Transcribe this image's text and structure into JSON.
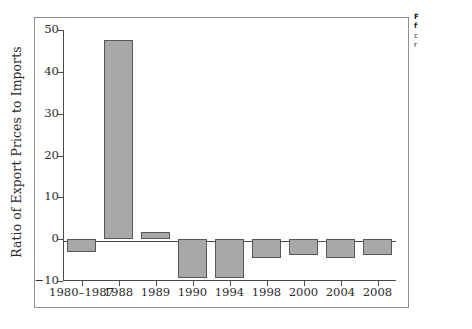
{
  "chart_data": {
    "type": "bar",
    "title": "",
    "xlabel": "",
    "ylabel": "Ratio of Export Prices to Imports",
    "categories": [
      "1980–1987",
      "1988",
      "1989",
      "1990",
      "1994",
      "1998",
      "2000",
      "2004",
      "2008"
    ],
    "values": [
      -3.0,
      47.5,
      1.7,
      -9.3,
      -9.2,
      -4.5,
      -3.7,
      -4.6,
      -3.7
    ],
    "ylim": [
      -10,
      50
    ],
    "ytick_labels": [
      "50",
      "40",
      "30",
      "20",
      "10",
      "0",
      "−10"
    ],
    "ytick_values": [
      50,
      40,
      30,
      20,
      10,
      0,
      -10
    ],
    "grid": false,
    "legend": "none",
    "bar_color": "#a8a8a8",
    "bar_edge_color": "#575757",
    "axis_color": "#4a4a4a"
  },
  "caption": {
    "line1": "F",
    "line2": "f",
    "line3": "c",
    "line4": "r"
  }
}
